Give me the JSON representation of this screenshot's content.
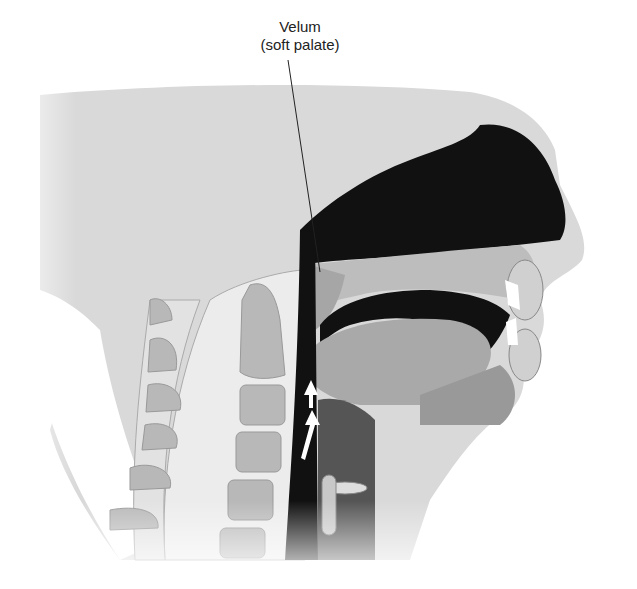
{
  "diagram": {
    "labels": [
      {
        "line1": "Velum",
        "line2": "(soft palate)"
      }
    ],
    "annotations": [
      "airflow-arrow-upper",
      "airflow-arrow-lower"
    ],
    "colors": {
      "skin": "#d9d9d9",
      "tissue": "#a9a9a9",
      "cavity": "#111111",
      "bone": "#ececec",
      "vertebra": "#b8b8b8",
      "pharynx": "#555555",
      "teeth": "#ffffff"
    }
  }
}
